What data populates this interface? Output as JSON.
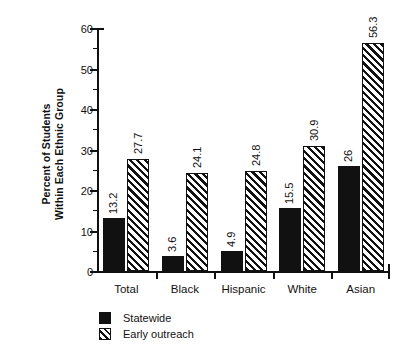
{
  "chart_data": {
    "type": "bar",
    "title": "",
    "xlabel": "",
    "ylabel": "Percent of Students Within Each Ethnic Group",
    "ylabel_lines": [
      "Percent of Students",
      "Within Each Ethnic Group"
    ],
    "categories": [
      "Total",
      "Black",
      "Hispanic",
      "White",
      "Asian"
    ],
    "series": [
      {
        "name": "Statewide",
        "fill": "solid-black",
        "values": [
          13.2,
          3.6,
          4.9,
          15.5,
          26
        ],
        "labels": [
          "13.2",
          "3.6",
          "4.9",
          "15.5",
          "26"
        ]
      },
      {
        "name": "Early outreach",
        "fill": "diagonal-hatch",
        "values": [
          27.7,
          24.1,
          24.8,
          30.9,
          56.3
        ],
        "labels": [
          "27.7",
          "24.1",
          "24.8",
          "30.9",
          "56.3"
        ]
      }
    ],
    "ylim": [
      0,
      60
    ],
    "yticks": [
      0,
      10,
      20,
      30,
      40,
      50,
      60
    ],
    "ytick_labels": [
      "0",
      "10",
      "20",
      "30",
      "40",
      "50",
      "60"
    ],
    "yminor_ticks": [
      5,
      15,
      25,
      35,
      45,
      55
    ],
    "grid": false,
    "legend_position": "bottom-left",
    "value_label_rotation": "vertical",
    "colors": {
      "foreground": "#111111",
      "background": "#ffffff"
    }
  },
  "legend": {
    "items": [
      {
        "label": "Statewide",
        "swatch": "solid-black"
      },
      {
        "label": "Early outreach",
        "swatch": "diagonal-hatch"
      }
    ]
  }
}
